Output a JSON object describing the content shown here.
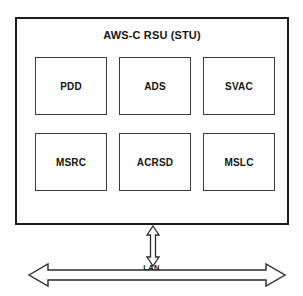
{
  "diagram": {
    "title": "AWS-C RSU (STU)",
    "system": {
      "label": "AWS-C RSU (STU)",
      "modules": [
        {
          "id": "pdd",
          "label": "PDD"
        },
        {
          "id": "ads",
          "label": "ADS"
        },
        {
          "id": "svac",
          "label": "SVAC"
        },
        {
          "id": "msrc",
          "label": "MSRC"
        },
        {
          "id": "acrsd",
          "label": "ACRSD"
        },
        {
          "id": "mslc",
          "label": "MSLC"
        }
      ]
    },
    "connections": {
      "vertical_link": {
        "icon": "double-headed-vertical-arrow-icon",
        "label": ""
      },
      "bus": {
        "icon": "double-headed-horizontal-arrow-icon",
        "label": "LAN"
      }
    },
    "colors": {
      "background": "#ffffff",
      "outer_border": "#1b1b1b",
      "module_border": "#3a3a3a",
      "text": "#141414",
      "arrow_stroke": "#2b2b2b"
    }
  }
}
